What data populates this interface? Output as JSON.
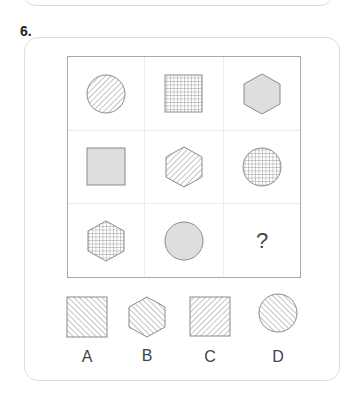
{
  "question": {
    "number": "6.",
    "grid": [
      [
        {
          "shape": "circle",
          "fill": "hatch-forward"
        },
        {
          "shape": "square",
          "fill": "crosshatch"
        },
        {
          "shape": "hexagon",
          "fill": "gray"
        }
      ],
      [
        {
          "shape": "square",
          "fill": "gray"
        },
        {
          "shape": "hexagon",
          "fill": "hatch-forward"
        },
        {
          "shape": "circle",
          "fill": "crosshatch"
        }
      ],
      [
        {
          "shape": "hexagon",
          "fill": "crosshatch"
        },
        {
          "shape": "circle",
          "fill": "gray"
        },
        {
          "shape": "unknown",
          "text": "?"
        }
      ]
    ],
    "missing_symbol": "?",
    "options": [
      {
        "label": "A",
        "shape": "square",
        "fill": "hatch-back"
      },
      {
        "label": "B",
        "shape": "hexagon",
        "fill": "hatch-back"
      },
      {
        "label": "C",
        "shape": "square",
        "fill": "hatch-forward"
      },
      {
        "label": "D",
        "shape": "circle",
        "fill": "hatch-back"
      }
    ]
  },
  "colors": {
    "stroke": "#8a8a8a",
    "gray_fill": "#dedede",
    "border": "#dcdcdc"
  }
}
